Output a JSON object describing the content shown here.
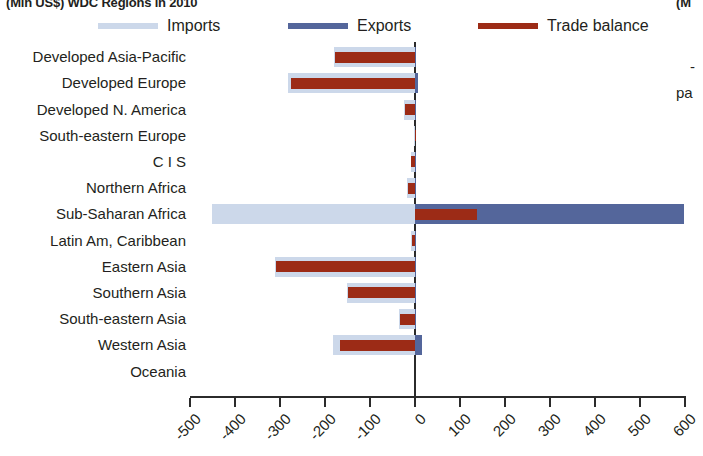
{
  "title": {
    "left": "(Mln US$) WDC Regions in 2010",
    "right": "(M"
  },
  "margin_fragments": {
    "dash": "-",
    "pa": "pa"
  },
  "legend": {
    "items": [
      {
        "label": "Imports",
        "color": "#ccd8ea",
        "name": "legend-imports"
      },
      {
        "label": "Exports",
        "color": "#54669b",
        "name": "legend-exports"
      },
      {
        "label": "Trade balance",
        "color": "#9c2b16",
        "name": "legend-trade-balance"
      }
    ]
  },
  "chart_data": {
    "type": "bar",
    "orientation": "horizontal",
    "title": "(Mln US$) WDC Regions in 2010",
    "xlabel": "",
    "ylabel": "",
    "xlim": [
      -500,
      600
    ],
    "xticks": [
      -500,
      -400,
      -300,
      -200,
      -100,
      0,
      100,
      200,
      300,
      400,
      500,
      600
    ],
    "xticklabels": [
      "-500",
      "-400",
      "-300",
      "-200",
      "-100",
      "0",
      "100",
      "200",
      "300",
      "400",
      "500",
      "600"
    ],
    "grid": false,
    "legend_position": "top",
    "categories": [
      "Developed Asia-Pacific",
      "Developed Europe",
      "Developed N. America",
      "South-eastern Europe",
      "C I S",
      "Northern Africa",
      "Sub-Saharan Africa",
      "Latin Am, Caribbean",
      "Eastern Asia",
      "Southern Asia",
      "South-eastern Asia",
      "Western Asia",
      "Oceania"
    ],
    "series": [
      {
        "name": "Imports",
        "color": "#ccd8ea",
        "values": [
          -180,
          -282,
          -24,
          -2,
          -10,
          -18,
          -451,
          -8,
          -312,
          -152,
          -36,
          -182,
          0
        ]
      },
      {
        "name": "Exports",
        "color": "#54669b",
        "values": [
          2,
          6,
          1,
          0,
          1,
          1,
          598,
          1,
          2,
          1,
          1,
          16,
          0
        ]
      },
      {
        "name": "Trade balance",
        "color": "#9c2b16",
        "values": [
          -178,
          -276,
          -22,
          -1,
          -9,
          -16,
          138,
          -7,
          -310,
          -150,
          -34,
          -166,
          0
        ]
      }
    ]
  }
}
